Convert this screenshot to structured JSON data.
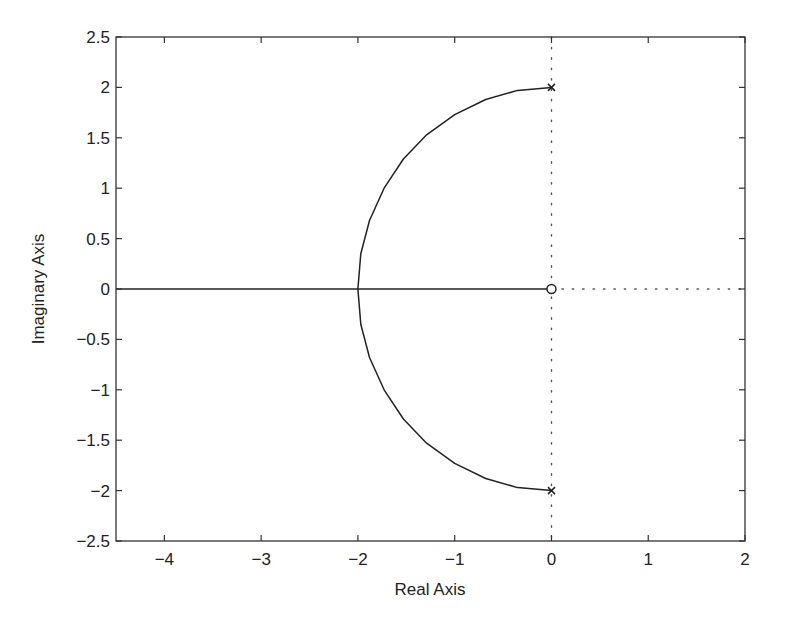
{
  "chart_data": {
    "type": "line",
    "title": "",
    "subtitle": "",
    "xlabel": "Real Axis",
    "ylabel": "Imaginary Axis",
    "xlim": [
      -4.5,
      2
    ],
    "ylim": [
      -2.5,
      2.5
    ],
    "grid": false,
    "legend": null,
    "x_ticks": [
      -4,
      -3,
      -2,
      -1,
      0,
      1,
      2
    ],
    "x_tick_labels": [
      "−4",
      "−3",
      "−2",
      "−1",
      "0",
      "1",
      "2"
    ],
    "y_ticks": [
      2.5,
      2,
      1.5,
      1,
      0.5,
      0,
      -0.5,
      -1,
      -1.5,
      -2,
      -2.5
    ],
    "y_tick_labels": [
      "2.5",
      "2",
      "1.5",
      "1",
      "0.5",
      "0",
      "−0.5",
      "−1",
      "−1.5",
      "−2",
      "−2.5"
    ],
    "poles": [
      {
        "re": 0,
        "im": 2,
        "marker": "x"
      },
      {
        "re": 0,
        "im": -2,
        "marker": "x"
      }
    ],
    "zeros": [
      {
        "re": 0,
        "im": 0,
        "marker": "o"
      }
    ],
    "series": [
      {
        "name": "locus-arc",
        "style": "solid",
        "points": [
          [
            0,
            2
          ],
          [
            -0.35,
            1.97
          ],
          [
            -0.68,
            1.88
          ],
          [
            -1.0,
            1.73
          ],
          [
            -1.29,
            1.53
          ],
          [
            -1.53,
            1.29
          ],
          [
            -1.73,
            1.0
          ],
          [
            -1.88,
            0.68
          ],
          [
            -1.97,
            0.35
          ],
          [
            -2.0,
            0
          ],
          [
            -1.97,
            -0.35
          ],
          [
            -1.88,
            -0.68
          ],
          [
            -1.73,
            -1.0
          ],
          [
            -1.53,
            -1.29
          ],
          [
            -1.29,
            -1.53
          ],
          [
            -1.0,
            -1.73
          ],
          [
            -0.68,
            -1.88
          ],
          [
            -0.35,
            -1.97
          ],
          [
            0,
            -2
          ]
        ]
      },
      {
        "name": "locus-real-axis",
        "style": "solid",
        "points": [
          [
            -4.5,
            0
          ],
          [
            0,
            0
          ]
        ]
      },
      {
        "name": "imaginary-axis-reference",
        "style": "dotted",
        "points": [
          [
            0,
            2.5
          ],
          [
            0,
            -2.5
          ]
        ]
      },
      {
        "name": "real-axis-reference",
        "style": "dotted",
        "points": [
          [
            0,
            0
          ],
          [
            2,
            0
          ]
        ]
      }
    ]
  },
  "colors": {
    "line": "#222222",
    "axes": "#333333",
    "background": "#ffffff"
  }
}
